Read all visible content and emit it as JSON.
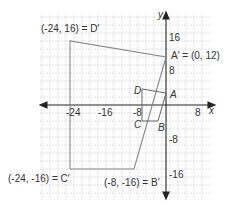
{
  "diagram": {
    "type": "coordinate-plane-dilation",
    "axes": {
      "x_label": "x",
      "y_label": "y",
      "x_ticks": [
        {
          "value": -24,
          "label": "-24"
        },
        {
          "value": -16,
          "label": "-16"
        },
        {
          "value": -8,
          "label": "-8"
        },
        {
          "value": 8,
          "label": "8"
        }
      ],
      "y_ticks": [
        {
          "value": 16,
          "label": "16"
        },
        {
          "value": 8,
          "label": "8"
        },
        {
          "value": -8,
          "label": "-8"
        },
        {
          "value": -16,
          "label": "-16"
        }
      ]
    },
    "original": {
      "A": {
        "label": "A",
        "x": 0,
        "y": 3
      },
      "B": {
        "label": "B",
        "x": -2,
        "y": -4
      },
      "C": {
        "label": "C",
        "x": -6,
        "y": -4
      },
      "D": {
        "label": "D",
        "x": -6,
        "y": 4
      }
    },
    "image": {
      "A_prime": {
        "label": "A′ = (0, 12)",
        "x": 0,
        "y": 12
      },
      "B_prime": {
        "label": "(-8, -16) = B′",
        "x": -8,
        "y": -16
      },
      "C_prime": {
        "label": "(-24, -16) = C′",
        "x": -24,
        "y": -16
      },
      "D_prime": {
        "label": "(-24, 16) = D′",
        "x": -24,
        "y": 16
      }
    },
    "colors": {
      "grid": "#cfcfcf",
      "axis": "#222222",
      "shape": "#888888",
      "text": "#333333"
    }
  }
}
